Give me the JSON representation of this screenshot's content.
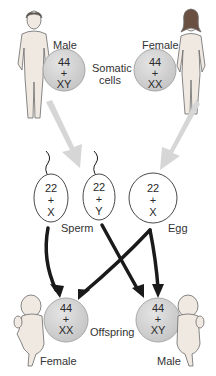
{
  "diagram": {
    "parents": {
      "male": {
        "label": "Male",
        "chrom_top": "44",
        "plus": "+",
        "chrom_bottom": "XY"
      },
      "female": {
        "label": "Female",
        "chrom_top": "44",
        "plus": "+",
        "chrom_bottom": "XX"
      },
      "somatic_label_line1": "Somatic",
      "somatic_label_line2": "cells"
    },
    "gametes": {
      "sperm_x": {
        "top": "22",
        "plus": "+",
        "bottom": "X"
      },
      "sperm_y": {
        "top": "22",
        "plus": "+",
        "bottom": "Y"
      },
      "egg": {
        "top": "22",
        "plus": "+",
        "bottom": "X"
      },
      "sperm_label": "Sperm",
      "egg_label": "Egg"
    },
    "offspring": {
      "female": {
        "label": "Female",
        "chrom_top": "44",
        "plus": "+",
        "chrom_bottom": "XX"
      },
      "male": {
        "label": "Male",
        "chrom_top": "44",
        "plus": "+",
        "chrom_bottom": "XY"
      },
      "offspring_label": "Offspring"
    },
    "colors": {
      "cell_fill": "#d2d2d2",
      "cell_stroke": "#a8a8a8",
      "gray_arrow": "#d6d6d6",
      "black_arrow": "#1a1a1a",
      "figure_fill": "#efe9e2",
      "figure_stroke": "#6a6a6a"
    }
  }
}
